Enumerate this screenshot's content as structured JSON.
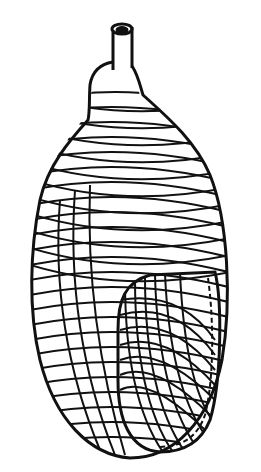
{
  "image": {
    "subject": "wicker-wrapped flask line drawing",
    "description": "Black ink illustration of a bottle with a narrow neck and spout, body covered in diagonal cross-hatched wicker wrapping, with a rounded inset panel on the lower right edged by a dashed seam",
    "colors": {
      "ink": "#111111",
      "background": "#ffffff"
    }
  }
}
